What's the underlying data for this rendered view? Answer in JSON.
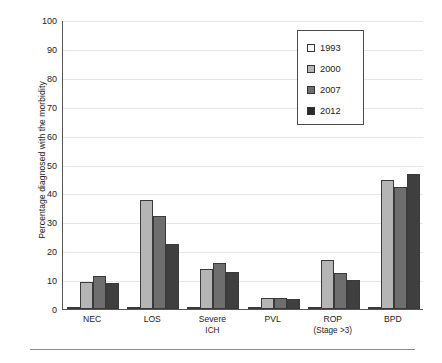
{
  "chart_data": {
    "type": "bar",
    "title": "",
    "subtitle": "",
    "xlabel": "",
    "ylabel": "Percentage diagnosed with the morbidity",
    "ylim": [
      0,
      100
    ],
    "yticks": [
      0,
      10,
      20,
      30,
      40,
      50,
      60,
      70,
      80,
      90,
      100
    ],
    "ytick_labels": [
      "0",
      "10",
      "20",
      "30",
      "40",
      "50",
      "60",
      "70",
      "80",
      "90",
      "100"
    ],
    "grid": "horizontal",
    "legend_position": "top-right",
    "categories": [
      "NEC",
      "LOS",
      "Severe ICH",
      "PVL",
      "ROP (Stage >3)",
      "BPD"
    ],
    "category_lines": [
      [
        "NEC",
        ""
      ],
      [
        "LOS",
        ""
      ],
      [
        "Severe",
        "ICH"
      ],
      [
        "PVL",
        ""
      ],
      [
        "ROP",
        "(Stage >3)"
      ],
      [
        "BPD",
        ""
      ]
    ],
    "series": [
      {
        "name": "1993",
        "color": "#ffffff",
        "values": [
          0.3,
          0.4,
          0.3,
          0.3,
          0.3,
          0.4
        ]
      },
      {
        "name": "2000",
        "color": "#b5b5b5",
        "values": [
          9.3,
          37.8,
          13.8,
          3.8,
          17.1,
          44.6
        ]
      },
      {
        "name": "2007",
        "color": "#6e6e6e",
        "values": [
          11.3,
          32.3,
          15.8,
          3.7,
          12.6,
          42.2
        ]
      },
      {
        "name": "2012",
        "color": "#3f3f3f",
        "values": [
          9.1,
          22.6,
          12.7,
          3.3,
          10.2,
          46.8
        ]
      }
    ]
  },
  "legend": {
    "items": [
      {
        "label": "1993"
      },
      {
        "label": "2000"
      },
      {
        "label": "2007"
      },
      {
        "label": "2012"
      }
    ]
  }
}
